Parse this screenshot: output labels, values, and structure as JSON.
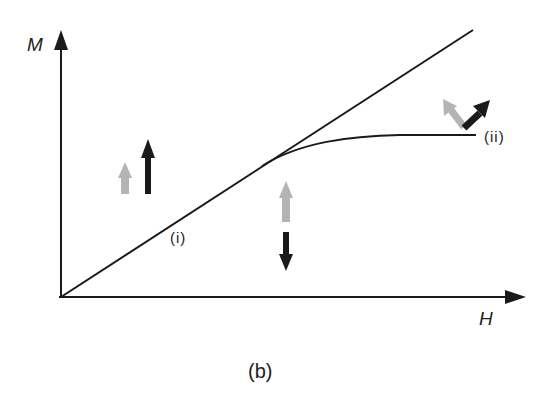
{
  "figure": {
    "caption": "(b)",
    "axes": {
      "y_label": "M",
      "x_label": "H"
    },
    "curves": [
      {
        "name": "linear-line",
        "description": "straight line M proportional to H through origin"
      },
      {
        "name": "saturating-curve",
        "description": "branches from the line and levels off"
      }
    ],
    "points": {
      "i": "(i)",
      "ii": "(ii)"
    },
    "spin_arrows": [
      {
        "region": "left",
        "gray": "up",
        "black": "up"
      },
      {
        "region": "middle",
        "gray": "up",
        "black": "down"
      },
      {
        "region": "right",
        "gray": "up-left",
        "black": "up-right"
      }
    ],
    "colors": {
      "line": "#1a1a1a",
      "black_arrow": "#1a1a1a",
      "gray_arrow": "#b4b4b4",
      "background": "#ffffff"
    }
  }
}
